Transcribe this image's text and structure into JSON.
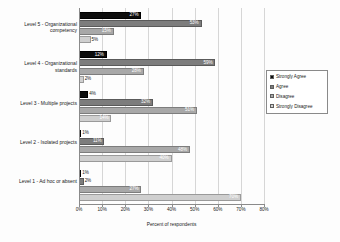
{
  "chart_data": {
    "type": "bar",
    "orientation": "horizontal",
    "title": "",
    "xlabel": "Percent of respondents",
    "ylabel": "",
    "xlim": [
      0,
      80
    ],
    "xticks": [
      "0%",
      "10%",
      "20%",
      "30%",
      "40%",
      "50%",
      "60%",
      "70%",
      "80%"
    ],
    "xtick_values": [
      0,
      10,
      20,
      30,
      40,
      50,
      60,
      70,
      80
    ],
    "grid": true,
    "legend_position": "right",
    "categories": [
      "Level 5 - Organizational competency",
      "Level 4 - Organizational standards",
      "Level 3 - Multiple projects",
      "Level 2 - Isolated projects",
      "Level 1 - Ad hoc or absent"
    ],
    "series": [
      {
        "name": "Strongly Agree",
        "color": "#0d0d0d",
        "values": [
          27,
          12,
          4,
          1,
          1
        ],
        "labels": [
          "27%",
          "12%",
          "4%",
          "1%",
          "1%"
        ]
      },
      {
        "name": "Agree",
        "color": "#7d7d7d",
        "values": [
          53,
          59,
          32,
          11,
          2
        ],
        "labels": [
          "53%",
          "59%",
          "32%",
          "11%",
          "2%"
        ]
      },
      {
        "name": "Disagree",
        "color": "#a8a8a8",
        "values": [
          15,
          28,
          51,
          48,
          27
        ],
        "labels": [
          "15%",
          "28%",
          "51%",
          "48%",
          "27%"
        ]
      },
      {
        "name": "Strongly Disagree",
        "color": "#cfcfcf",
        "values": [
          5,
          2,
          14,
          40,
          70
        ],
        "labels": [
          "5%",
          "2%",
          "14%",
          "40%",
          "70%"
        ]
      }
    ]
  },
  "legend": {
    "items": [
      {
        "label": "Strongly Agree"
      },
      {
        "label": "Agree"
      },
      {
        "label": "Disagree"
      },
      {
        "label": "Strongly Disagree"
      }
    ]
  }
}
